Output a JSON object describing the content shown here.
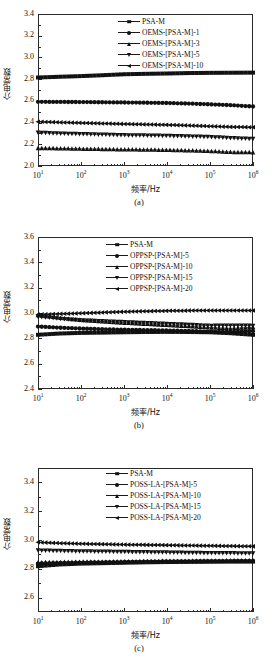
{
  "figure": {
    "axis_y_label": "介电常数",
    "axis_x_label": "频率/Hz"
  },
  "chart_data": [
    {
      "type": "line",
      "title": "",
      "caption": "(a)",
      "xlabel": "频率/Hz",
      "ylabel": "介电常数",
      "xscale": "log",
      "xlim": [
        10,
        1000000
      ],
      "ylim": [
        2.0,
        3.4
      ],
      "yticks": [
        "2.0",
        "2.2",
        "2.4",
        "2.6",
        "2.8",
        "3.0",
        "3.2",
        "3.4"
      ],
      "xticks": [
        "10",
        "10",
        "10",
        "10",
        "10",
        "10"
      ],
      "xtick_exponents": [
        "1",
        "2",
        "3",
        "4",
        "5",
        "6"
      ],
      "grid": false,
      "legend_position": "upper-center",
      "series": [
        {
          "name": "PSA-M",
          "marker": "square",
          "x": [
            10,
            31.6,
            100,
            316,
            1000,
            3160,
            10000,
            31600,
            100000,
            316000,
            1000000
          ],
          "values": [
            2.815,
            2.822,
            2.828,
            2.836,
            2.845,
            2.849,
            2.852,
            2.856,
            2.858,
            2.859,
            2.86
          ]
        },
        {
          "name": "OEMS-[PSA-M]-1",
          "marker": "circle",
          "x": [
            10,
            31.6,
            100,
            316,
            1000,
            3160,
            10000,
            31600,
            100000,
            316000,
            1000000
          ],
          "values": [
            2.591,
            2.59,
            2.589,
            2.587,
            2.585,
            2.583,
            2.58,
            2.575,
            2.568,
            2.56,
            2.548
          ]
        },
        {
          "name": "OEMS-[PSA-M]-3",
          "marker": "triangle-up",
          "x": [
            10,
            31.6,
            100,
            316,
            1000,
            3160,
            10000,
            31600,
            100000,
            316000,
            1000000
          ],
          "values": [
            2.164,
            2.162,
            2.158,
            2.155,
            2.152,
            2.15,
            2.147,
            2.143,
            2.137,
            2.128,
            2.125
          ]
        },
        {
          "name": "OEMS-[PSA-M]-5",
          "marker": "triangle-down",
          "x": [
            10,
            31.6,
            100,
            316,
            1000,
            3160,
            10000,
            31600,
            100000,
            316000,
            1000000
          ],
          "values": [
            2.308,
            2.3,
            2.295,
            2.29,
            2.285,
            2.282,
            2.279,
            2.274,
            2.268,
            2.258,
            2.25
          ]
        },
        {
          "name": "OEMS-[PSA-M]-10",
          "marker": "triangle-left",
          "x": [
            10,
            31.6,
            100,
            316,
            1000,
            3160,
            10000,
            31600,
            100000,
            316000,
            1000000
          ],
          "values": [
            2.408,
            2.402,
            2.397,
            2.392,
            2.387,
            2.383,
            2.379,
            2.373,
            2.366,
            2.36,
            2.357
          ]
        }
      ]
    },
    {
      "type": "line",
      "title": "",
      "caption": "(b)",
      "xlabel": "频率/Hz",
      "ylabel": "介电常数",
      "xscale": "log",
      "xlim": [
        10,
        1000000
      ],
      "ylim": [
        2.4,
        3.6
      ],
      "yticks": [
        "2.4",
        "2.6",
        "2.8",
        "3.0",
        "3.2",
        "3.4",
        "3.6"
      ],
      "xticks": [
        "10",
        "10",
        "10",
        "10",
        "10",
        "10"
      ],
      "xtick_exponents": [
        "1",
        "2",
        "3",
        "4",
        "5",
        "6"
      ],
      "grid": false,
      "legend_position": "upper-center",
      "series": [
        {
          "name": "PSA-M",
          "marker": "square",
          "x": [
            10,
            31.6,
            100,
            316,
            1000,
            3160,
            10000,
            31600,
            100000,
            316000,
            1000000
          ],
          "values": [
            2.828,
            2.838,
            2.843,
            2.845,
            2.848,
            2.85,
            2.851,
            2.85,
            2.848,
            2.84,
            2.828
          ]
        },
        {
          "name": "OPPSP-[PSA-M]-5",
          "marker": "circle",
          "x": [
            10,
            31.6,
            100,
            316,
            1000,
            3160,
            10000,
            31600,
            100000,
            316000,
            1000000
          ],
          "values": [
            2.893,
            2.884,
            2.877,
            2.872,
            2.868,
            2.865,
            2.862,
            2.858,
            2.852,
            2.85,
            2.858
          ]
        },
        {
          "name": "OPPSP-[PSA-M]-10",
          "marker": "triangle-up",
          "x": [
            10,
            31.6,
            100,
            316,
            1000,
            3160,
            10000,
            31600,
            100000,
            316000,
            1000000
          ],
          "values": [
            2.982,
            2.962,
            2.944,
            2.932,
            2.922,
            2.913,
            2.904,
            2.895,
            2.885,
            2.878,
            2.888
          ]
        },
        {
          "name": "OPPSP-[PSA-M]-15",
          "marker": "triangle-down",
          "x": [
            10,
            31.6,
            100,
            316,
            1000,
            3160,
            10000,
            31600,
            100000,
            316000,
            1000000
          ],
          "values": [
            2.972,
            2.956,
            2.944,
            2.936,
            2.929,
            2.922,
            2.915,
            2.908,
            2.9,
            2.902,
            2.9
          ]
        },
        {
          "name": "OPPSP-[PSA-M]-20",
          "marker": "triangle-left",
          "x": [
            10,
            31.6,
            100,
            316,
            1000,
            3160,
            10000,
            31600,
            100000,
            316000,
            1000000
          ],
          "values": [
            2.988,
            2.993,
            2.998,
            3.004,
            3.01,
            3.014,
            3.017,
            3.019,
            3.02,
            3.02,
            3.02
          ]
        }
      ]
    },
    {
      "type": "line",
      "title": "",
      "caption": "(c)",
      "xlabel": "频率/Hz",
      "ylabel": "介电常数",
      "xscale": "log",
      "xlim": [
        10,
        1000000
      ],
      "ylim": [
        2.5,
        3.5
      ],
      "yticks": [
        "2.6",
        "2.8",
        "3.0",
        "3.2",
        "3.4"
      ],
      "xticks": [
        "10",
        "10",
        "10",
        "10",
        "10",
        "10"
      ],
      "xtick_exponents": [
        "1",
        "2",
        "3",
        "4",
        "5",
        "6"
      ],
      "grid": false,
      "legend_position": "upper-center",
      "series": [
        {
          "name": "PSA-M",
          "marker": "square",
          "x": [
            10,
            31.6,
            100,
            316,
            1000,
            3160,
            10000,
            31600,
            100000,
            316000,
            1000000
          ],
          "values": [
            2.818,
            2.83,
            2.836,
            2.839,
            2.842,
            2.845,
            2.847,
            2.848,
            2.849,
            2.85,
            2.85
          ]
        },
        {
          "name": "POSS-LA-[PSA-M]-5",
          "marker": "circle",
          "x": [
            10,
            31.6,
            100,
            316,
            1000,
            3160,
            10000,
            31600,
            100000,
            316000,
            1000000
          ],
          "values": [
            2.836,
            2.84,
            2.843,
            2.845,
            2.847,
            2.849,
            2.851,
            2.852,
            2.853,
            2.854,
            2.854
          ]
        },
        {
          "name": "POSS-LA-[PSA-M]-10",
          "marker": "triangle-up",
          "x": [
            10,
            31.6,
            100,
            316,
            1000,
            3160,
            10000,
            31600,
            100000,
            316000,
            1000000
          ],
          "values": [
            2.844,
            2.846,
            2.848,
            2.849,
            2.851,
            2.852,
            2.854,
            2.855,
            2.856,
            2.857,
            2.857
          ]
        },
        {
          "name": "POSS-LA-[PSA-M]-15",
          "marker": "triangle-down",
          "x": [
            10,
            31.6,
            100,
            316,
            1000,
            3160,
            10000,
            31600,
            100000,
            316000,
            1000000
          ],
          "values": [
            2.928,
            2.925,
            2.922,
            2.92,
            2.918,
            2.916,
            2.914,
            2.912,
            2.91,
            2.909,
            2.908
          ]
        },
        {
          "name": "POSS-LA-[PSA-M]-20",
          "marker": "triangle-left",
          "x": [
            10,
            31.6,
            100,
            316,
            1000,
            3160,
            10000,
            31600,
            100000,
            316000,
            1000000
          ],
          "values": [
            2.984,
            2.978,
            2.974,
            2.971,
            2.968,
            2.966,
            2.964,
            2.962,
            2.96,
            2.958,
            2.956
          ]
        }
      ]
    }
  ]
}
